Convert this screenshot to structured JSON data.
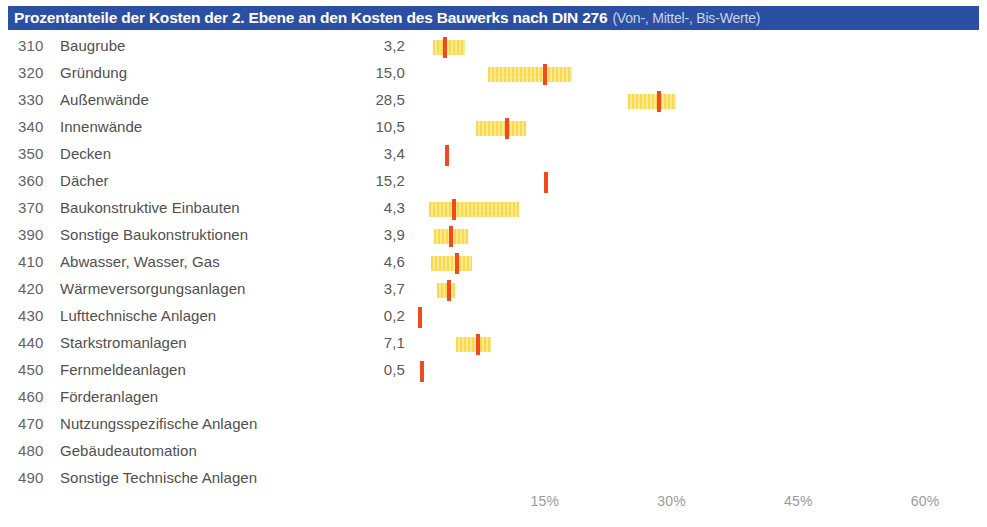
{
  "header": {
    "title_main": "Prozentanteile der Kosten der 2. Ebene an den Kosten des Bauwerks nach DIN 276",
    "title_sub": "(Von-, Mittel-, Bis-Werte)",
    "bar_color": "#2b4fa2",
    "title_color": "#ffffff",
    "subtitle_color": "#c9d4ec"
  },
  "chart_data": {
    "type": "bar",
    "title": "Prozentanteile der Kosten der 2. Ebene an den Kosten des Bauwerks nach DIN 276 (Von-, Mittel-, Bis-Werte)",
    "xlabel": "",
    "ylabel": "",
    "xlim": [
      0,
      65
    ],
    "grid": false,
    "legend": null,
    "value_unit": "%",
    "series_names": [
      "Von-Wert",
      "Mittel-Wert",
      "Bis-Wert"
    ],
    "range_color": "#fcd94b",
    "mid_color": "#f04b1e",
    "tick_labels": [
      "15%",
      "30%",
      "45%",
      "60%"
    ],
    "tick_values": [
      15,
      30,
      45,
      60
    ],
    "rows": [
      {
        "code": "310",
        "label": "Baugrube",
        "value": "3,2",
        "mid": 3.2,
        "low": 1.8,
        "high": 5.6
      },
      {
        "code": "320",
        "label": "Gründung",
        "value": "15,0",
        "mid": 15.0,
        "low": 8.3,
        "high": 18.2
      },
      {
        "code": "330",
        "label": "Außenwände",
        "value": "28,5",
        "mid": 28.5,
        "low": 24.8,
        "high": 30.5
      },
      {
        "code": "340",
        "label": "Innenwände",
        "value": "10,5",
        "mid": 10.5,
        "low": 6.9,
        "high": 12.8
      },
      {
        "code": "350",
        "label": "Decken",
        "value": "3,4",
        "mid": 3.4,
        "low": 3.4,
        "high": 3.4
      },
      {
        "code": "360",
        "label": "Dächer",
        "value": "15,2",
        "mid": 15.2,
        "low": 15.2,
        "high": 15.2
      },
      {
        "code": "370",
        "label": "Baukonstruktive Einbauten",
        "value": "4,3",
        "mid": 4.3,
        "low": 1.3,
        "high": 12.0
      },
      {
        "code": "390",
        "label": "Sonstige Baukonstruktionen",
        "value": "3,9",
        "mid": 3.9,
        "low": 1.9,
        "high": 5.9
      },
      {
        "code": "410",
        "label": "Abwasser, Wasser, Gas",
        "value": "4,6",
        "mid": 4.6,
        "low": 1.5,
        "high": 6.4
      },
      {
        "code": "420",
        "label": "Wärmeversorgungsanlagen",
        "value": "3,7",
        "mid": 3.7,
        "low": 2.3,
        "high": 4.4
      },
      {
        "code": "430",
        "label": "Lufttechnische Anlagen",
        "value": "0,2",
        "mid": 0.2,
        "low": 0.2,
        "high": 0.2
      },
      {
        "code": "440",
        "label": "Starkstromanlagen",
        "value": "7,1",
        "mid": 7.1,
        "low": 4.5,
        "high": 8.6
      },
      {
        "code": "450",
        "label": "Fernmeldeanlagen",
        "value": "0,5",
        "mid": 0.5,
        "low": 0.5,
        "high": 0.5
      },
      {
        "code": "460",
        "label": "Förderanlagen",
        "value": "",
        "mid": null,
        "low": null,
        "high": null
      },
      {
        "code": "470",
        "label": "Nutzungsspezifische Anlagen",
        "value": "",
        "mid": null,
        "low": null,
        "high": null
      },
      {
        "code": "480",
        "label": "Gebäudeautomation",
        "value": "",
        "mid": null,
        "low": null,
        "high": null
      },
      {
        "code": "490",
        "label": "Sonstige Technische Anlagen",
        "value": "",
        "mid": null,
        "low": null,
        "high": null
      }
    ]
  },
  "axis": {
    "origin_px": 418,
    "px_per_percent": 8.45
  }
}
